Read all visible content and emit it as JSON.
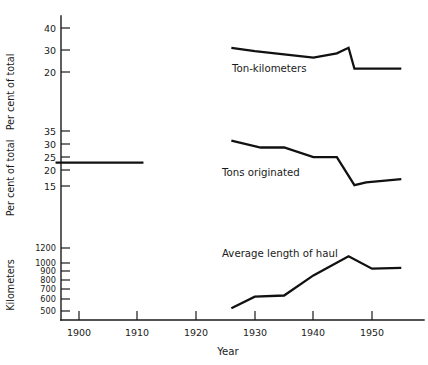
{
  "chart_data": {
    "type": "line",
    "title": "",
    "xlabel": "Year",
    "xlim": [
      1894,
      1956
    ],
    "xticks": [
      1900,
      1910,
      1920,
      1930,
      1940,
      1950
    ],
    "xticklabels": [
      "1900",
      "1910",
      "1920",
      "1930",
      "1940",
      "1950"
    ],
    "grid": false,
    "legend": "inline-annotations",
    "panels": [
      {
        "id": "ton-kilometers",
        "series_label": "Ton-kilometers",
        "ylabel": "Per cent of total",
        "yticks": [
          20,
          30,
          40
        ],
        "yticklabels": [
          "20",
          "30",
          "40"
        ],
        "ylim": [
          14,
          44
        ],
        "yscale": "linear",
        "x": [
          1926,
          1930,
          1935,
          1940,
          1944,
          1946,
          1947,
          1950,
          1955
        ],
        "values": [
          31.0,
          29.5,
          28.0,
          26.5,
          28.5,
          31.0,
          21.5,
          21.5,
          21.5
        ]
      },
      {
        "id": "tons-originated",
        "series_label": "Tons originated",
        "ylabel": "Per cent of total",
        "yticks": [
          15,
          20,
          25,
          30,
          35
        ],
        "yticklabels": [
          "15",
          "20",
          "25",
          "30",
          "35"
        ],
        "ylim": [
          12,
          38
        ],
        "yscale": "linear",
        "early_x": [
          1896,
          1911
        ],
        "early_values": [
          23.5,
          23.5
        ],
        "x": [
          1926,
          1931,
          1935,
          1940,
          1944,
          1947,
          1949,
          1955
        ],
        "values": [
          31.5,
          29.0,
          29.0,
          25.5,
          25.5,
          15.3,
          16.3,
          17.5
        ]
      },
      {
        "id": "average-length-of-haul",
        "series_label": "Average length of haul",
        "ylabel": "Kilometers",
        "yticks": [
          500,
          600,
          700,
          800,
          900,
          1000,
          1200
        ],
        "yticklabels": [
          "500",
          "600",
          "700",
          "800",
          "900",
          "1000",
          "1200"
        ],
        "ylim": [
          440,
          1320
        ],
        "yscale": "log",
        "x": [
          1926,
          1930,
          1935,
          1940,
          1946,
          1950,
          1955
        ],
        "values": [
          520,
          610,
          620,
          820,
          1070,
          900,
          910
        ]
      }
    ]
  }
}
